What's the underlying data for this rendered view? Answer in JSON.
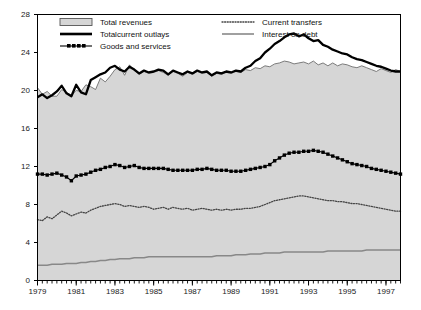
{
  "chart_data": {
    "type": "line",
    "title": "",
    "subtitle": "",
    "xlabel": "",
    "ylabel": "",
    "grid": false,
    "legend_position": "top-inside",
    "xlim": [
      1979.0,
      1997.75
    ],
    "ylim": [
      0,
      28
    ],
    "yticks": [
      0,
      4,
      8,
      12,
      16,
      20,
      24,
      28
    ],
    "xticks": [
      1979,
      1981,
      1983,
      1985,
      1987,
      1989,
      1991,
      1993,
      1995,
      1997
    ],
    "xtick_labels": [
      "1979",
      "1981",
      "1983",
      "1985",
      "1987",
      "1989",
      "1991",
      "1993",
      "1995",
      "1997"
    ],
    "ytick_labels": [
      "0",
      "4",
      "8",
      "12",
      "16",
      "20",
      "24",
      "28"
    ],
    "x_minor_tick_interval": 0.25,
    "frequency": "quarterly",
    "x": [
      1979.0,
      1979.25,
      1979.5,
      1979.75,
      1980.0,
      1980.25,
      1980.5,
      1980.75,
      1981.0,
      1981.25,
      1981.5,
      1981.75,
      1982.0,
      1982.25,
      1982.5,
      1982.75,
      1983.0,
      1983.25,
      1983.5,
      1983.75,
      1984.0,
      1984.25,
      1984.5,
      1984.75,
      1985.0,
      1985.25,
      1985.5,
      1985.75,
      1986.0,
      1986.25,
      1986.5,
      1986.75,
      1987.0,
      1987.25,
      1987.5,
      1987.75,
      1988.0,
      1988.25,
      1988.5,
      1988.75,
      1989.0,
      1989.25,
      1989.5,
      1989.75,
      1990.0,
      1990.25,
      1990.5,
      1990.75,
      1991.0,
      1991.25,
      1991.5,
      1991.75,
      1992.0,
      1992.25,
      1992.5,
      1992.75,
      1993.0,
      1993.25,
      1993.5,
      1993.75,
      1994.0,
      1994.25,
      1994.5,
      1994.75,
      1995.0,
      1995.25,
      1995.5,
      1995.75,
      1996.0,
      1996.25,
      1996.5,
      1996.75,
      1997.0,
      1997.25,
      1997.5,
      1997.75
    ],
    "series": [
      {
        "name": "Total revenues",
        "style": "filled-area",
        "color": "#d6d6d6",
        "edge_color": "#6e6e6e",
        "values": [
          20.3,
          19.6,
          19.9,
          19.4,
          19.4,
          20.1,
          19.8,
          19.5,
          20.0,
          19.9,
          20.6,
          20.4,
          20.1,
          21.3,
          20.9,
          21.5,
          22.2,
          22.5,
          21.6,
          22.7,
          22.1,
          21.7,
          22.0,
          21.8,
          21.9,
          22.1,
          21.9,
          21.6,
          22.0,
          21.8,
          21.5,
          21.9,
          21.7,
          22.0,
          21.8,
          21.9,
          21.5,
          21.8,
          21.7,
          21.9,
          21.8,
          22.0,
          21.9,
          22.2,
          22.1,
          22.4,
          22.3,
          22.6,
          22.5,
          22.8,
          22.9,
          23.1,
          23.0,
          22.8,
          22.9,
          23.0,
          22.8,
          23.1,
          22.7,
          22.9,
          22.6,
          22.9,
          22.6,
          22.8,
          22.7,
          22.5,
          22.4,
          22.6,
          22.4,
          22.2,
          22.0,
          22.3,
          22.1,
          21.9,
          22.2,
          22.0
        ]
      },
      {
        "name": "Totalcurrent outlays",
        "style": "thick-solid",
        "color": "#000000",
        "values": [
          19.3,
          19.6,
          19.2,
          19.5,
          19.9,
          20.5,
          19.7,
          19.4,
          20.6,
          19.8,
          19.6,
          21.1,
          21.4,
          21.7,
          21.9,
          22.4,
          22.6,
          22.2,
          22.0,
          22.5,
          22.2,
          21.8,
          22.1,
          21.9,
          22.0,
          22.2,
          22.1,
          21.7,
          22.1,
          21.9,
          21.7,
          22.0,
          21.8,
          22.1,
          21.9,
          22.0,
          21.6,
          21.9,
          21.8,
          22.0,
          21.9,
          22.1,
          22.0,
          22.4,
          22.6,
          23.1,
          23.4,
          24.0,
          24.4,
          24.9,
          25.2,
          25.6,
          25.9,
          26.0,
          25.7,
          25.9,
          25.5,
          25.2,
          25.3,
          24.8,
          24.6,
          24.3,
          24.1,
          23.9,
          23.8,
          23.5,
          23.3,
          23.2,
          23.0,
          22.8,
          22.6,
          22.5,
          22.3,
          22.1,
          22.0,
          22.0
        ]
      },
      {
        "name": "Goods and services",
        "style": "marker-squares",
        "color": "#000000",
        "values": [
          11.2,
          11.2,
          11.1,
          11.2,
          11.3,
          11.1,
          10.9,
          10.5,
          11.0,
          11.1,
          11.2,
          11.4,
          11.6,
          11.7,
          11.9,
          12.0,
          12.2,
          12.1,
          11.9,
          12.0,
          12.1,
          11.9,
          11.8,
          11.8,
          11.8,
          11.8,
          11.8,
          11.7,
          11.6,
          11.6,
          11.6,
          11.6,
          11.6,
          11.7,
          11.7,
          11.8,
          11.7,
          11.6,
          11.6,
          11.6,
          11.5,
          11.5,
          11.5,
          11.6,
          11.7,
          11.8,
          11.9,
          12.0,
          12.2,
          12.6,
          12.9,
          13.2,
          13.4,
          13.5,
          13.5,
          13.6,
          13.6,
          13.7,
          13.6,
          13.5,
          13.3,
          13.1,
          12.9,
          12.7,
          12.5,
          12.3,
          12.2,
          12.1,
          12.0,
          11.8,
          11.7,
          11.6,
          11.5,
          11.4,
          11.3,
          11.2
        ]
      },
      {
        "name": "Current transfers",
        "style": "dotted",
        "color": "#444444",
        "values": [
          6.4,
          6.3,
          6.7,
          6.5,
          6.9,
          7.3,
          7.1,
          6.8,
          7.0,
          7.2,
          7.1,
          7.4,
          7.6,
          7.8,
          7.9,
          8.0,
          8.1,
          8.0,
          7.8,
          7.9,
          7.8,
          7.7,
          7.8,
          7.7,
          7.5,
          7.6,
          7.7,
          7.5,
          7.7,
          7.6,
          7.5,
          7.6,
          7.4,
          7.5,
          7.6,
          7.5,
          7.4,
          7.5,
          7.4,
          7.5,
          7.4,
          7.5,
          7.5,
          7.6,
          7.6,
          7.7,
          7.8,
          8.0,
          8.2,
          8.4,
          8.5,
          8.6,
          8.7,
          8.8,
          8.9,
          8.9,
          8.8,
          8.7,
          8.6,
          8.5,
          8.4,
          8.4,
          8.3,
          8.3,
          8.2,
          8.1,
          8.1,
          8.0,
          7.9,
          7.8,
          7.7,
          7.6,
          7.5,
          7.4,
          7.3,
          7.3
        ]
      },
      {
        "name": "Interest on debt",
        "style": "thin-gray",
        "color": "#888888",
        "values": [
          1.6,
          1.6,
          1.6,
          1.7,
          1.7,
          1.7,
          1.8,
          1.8,
          1.8,
          1.9,
          1.9,
          2.0,
          2.0,
          2.1,
          2.1,
          2.2,
          2.2,
          2.3,
          2.3,
          2.3,
          2.4,
          2.4,
          2.4,
          2.5,
          2.5,
          2.5,
          2.5,
          2.5,
          2.5,
          2.5,
          2.5,
          2.5,
          2.5,
          2.5,
          2.5,
          2.5,
          2.5,
          2.6,
          2.6,
          2.6,
          2.6,
          2.7,
          2.7,
          2.7,
          2.8,
          2.8,
          2.8,
          2.9,
          2.9,
          2.9,
          2.9,
          3.0,
          3.0,
          3.0,
          3.0,
          3.0,
          3.0,
          3.0,
          3.0,
          3.0,
          3.1,
          3.1,
          3.1,
          3.1,
          3.1,
          3.1,
          3.1,
          3.1,
          3.2,
          3.2,
          3.2,
          3.2,
          3.2,
          3.2,
          3.2,
          3.2
        ]
      }
    ]
  },
  "legend": {
    "items": [
      {
        "label": "Total revenues",
        "swatch": "filled-area"
      },
      {
        "label": "Totalcurrent outlays",
        "swatch": "thick-solid"
      },
      {
        "label": "Goods and services",
        "swatch": "marker-squares"
      },
      {
        "label": "Current transfers",
        "swatch": "dotted"
      },
      {
        "label": "Interest on debt",
        "swatch": "thin-gray"
      }
    ]
  }
}
